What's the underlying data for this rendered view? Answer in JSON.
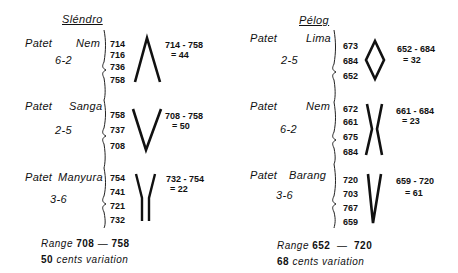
{
  "slendro": {
    "title": "Sléndro",
    "groups": [
      {
        "patet_label": "Patet",
        "name": "Nem",
        "numbers": "6-2",
        "values": [
          "714",
          "716",
          "736",
          "758"
        ],
        "range_expr": "714 - 758",
        "range_diff": "= 44",
        "glyph": "lambda-shape"
      },
      {
        "patet_label": "Patet",
        "name": "Sanga",
        "numbers": "2-5",
        "values": [
          "758",
          "737",
          "708"
        ],
        "range_expr": "708 - 758",
        "range_diff": "= 50",
        "glyph": "v-shape"
      },
      {
        "patet_label": "Patet",
        "name": "Manyura",
        "numbers": "3-6",
        "values": [
          "754",
          "741",
          "721",
          "732"
        ],
        "range_expr": "732 - 754",
        "range_diff": "= 22",
        "glyph": "y-shape"
      }
    ],
    "footer": {
      "range_label": "Range",
      "range_low": "708",
      "range_dash": "—",
      "range_high": "758",
      "cents_value": "50",
      "cents_label": "cents variation"
    }
  },
  "pelog": {
    "title": "Pélog",
    "groups": [
      {
        "patet_label": "Patet",
        "name": "Lima",
        "numbers": "2-5",
        "values": [
          "673",
          "684",
          "652"
        ],
        "range_expr": "652 - 684",
        "range_diff": "= 32",
        "glyph": "diamond-shape"
      },
      {
        "patet_label": "Patet",
        "name": "Nem",
        "numbers": "6-2",
        "values": [
          "672",
          "661",
          "675",
          "684"
        ],
        "range_expr": "661 - 684",
        "range_diff": "= 23",
        "glyph": "x-shape"
      },
      {
        "patet_label": "Patet",
        "name": "Barang",
        "numbers": "3-6",
        "values": [
          "720",
          "703",
          "767",
          "659"
        ],
        "range_expr": "659 - 720",
        "range_diff": "= 61",
        "glyph": "narrow-v-shape"
      }
    ],
    "footer": {
      "range_label": "Range",
      "range_low": "652",
      "range_dash": "—",
      "range_high": "720",
      "cents_value": "68",
      "cents_label": "cents variation"
    }
  }
}
